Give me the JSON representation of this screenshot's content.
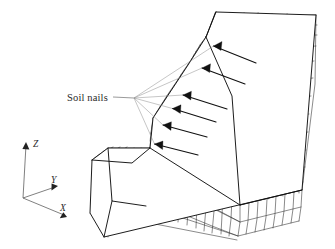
{
  "figure": {
    "kind": "3d-finite-element-mesh",
    "background_color": "#ffffff",
    "width": 335,
    "height": 249
  },
  "annotations": {
    "soil_nails_label": "Soil nails",
    "leader_origin": {
      "x": 134,
      "y": 98
    },
    "leader_stem_start": {
      "x": 113,
      "y": 97
    },
    "nail_count": 6,
    "nail_heads": [
      {
        "x": 213.5,
        "y": 46.0,
        "angle": 22
      },
      {
        "x": 202.0,
        "y": 68.0,
        "angle": 20
      },
      {
        "x": 183.0,
        "y": 95.0,
        "angle": 18
      },
      {
        "x": 172.5,
        "y": 108.5,
        "angle": 18
      },
      {
        "x": 163.0,
        "y": 125.0,
        "angle": 16
      },
      {
        "x": 154.5,
        "y": 144.0,
        "angle": 16
      }
    ],
    "nail_shaft_length": 46
  },
  "axes": {
    "origin": {
      "x": 23,
      "y": 198
    },
    "items": [
      {
        "id": "z",
        "label": "Z",
        "tip": {
          "x": 26,
          "y": 143
        },
        "label_pos": {
          "x": 33,
          "y": 146
        }
      },
      {
        "id": "y",
        "label": "Y",
        "tip": {
          "x": 57,
          "y": 188
        },
        "label_pos": {
          "x": 52,
          "y": 182
        }
      },
      {
        "id": "x",
        "label": "X",
        "tip": {
          "x": 66,
          "y": 217
        },
        "label_pos": {
          "x": 61,
          "y": 210
        }
      }
    ]
  },
  "colors": {
    "mesh_stroke": "#2b2b2b",
    "outline_stroke": "#111111",
    "leader_stroke": "#8c8c8c",
    "axis_stroke": "#555555",
    "nail_fill": "#111111",
    "text_fill": "#2a2a2a",
    "face_fill": "#ffffff"
  },
  "geometry": {
    "comment": "Key silhouette vertices of the slope block in image pixel coordinates.",
    "outline": [
      {
        "x": 216,
        "y": 12
      },
      {
        "x": 316,
        "y": 15
      },
      {
        "x": 302,
        "y": 190
      },
      {
        "x": 104,
        "y": 237
      },
      {
        "x": 90,
        "y": 213
      },
      {
        "x": 92,
        "y": 160
      },
      {
        "x": 108,
        "y": 148
      },
      {
        "x": 150,
        "y": 148
      },
      {
        "x": 153,
        "y": 118
      },
      {
        "x": 188,
        "y": 65
      },
      {
        "x": 206,
        "y": 37
      }
    ],
    "crest_ridge": [
      {
        "x": 216,
        "y": 12
      },
      {
        "x": 206,
        "y": 37
      }
    ],
    "bench_edge": [
      {
        "x": 150,
        "y": 148
      },
      {
        "x": 108,
        "y": 148
      }
    ],
    "slope_face_rows": 14,
    "slope_face_cols": 12,
    "right_face_rows": 11,
    "right_face_cols": 7,
    "toe_face_cols": 18,
    "toe_face_rows": 5
  }
}
